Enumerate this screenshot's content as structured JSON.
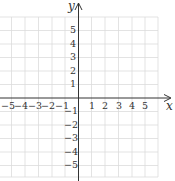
{
  "axes": {
    "x_label": "x",
    "y_label": "y",
    "x_ticks": [
      "−5",
      "−4",
      "−3",
      "−2",
      "−1",
      "1",
      "2",
      "3",
      "4",
      "5"
    ],
    "y_ticks": [
      "5",
      "4",
      "3",
      "2",
      "1",
      "−1",
      "−2",
      "−3",
      "−4",
      "−5"
    ]
  },
  "grid": {
    "x_range": [
      -6,
      6
    ],
    "y_range": [
      -6,
      6
    ],
    "color": "#d9d9d9",
    "axis_color": "#333333"
  }
}
